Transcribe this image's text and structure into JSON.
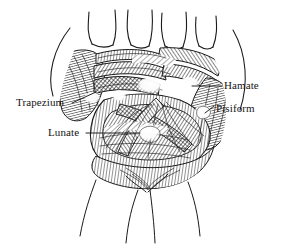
{
  "figure": {
    "type": "anatomical-line-drawing",
    "background_color": "#ffffff",
    "ink_color": "#1a1a1a",
    "width": 281,
    "height": 245
  },
  "labels": [
    {
      "id": "trapezium",
      "text": "Trapezium",
      "side": "left",
      "leader": {
        "from_x": 72,
        "from_y": 103,
        "to_x": 96,
        "to_y": 92
      }
    },
    {
      "id": "lunate",
      "text": "Lunate",
      "side": "left",
      "leader": {
        "from_x": 86,
        "from_y": 133,
        "to_x": 140,
        "to_y": 133
      }
    },
    {
      "id": "hamate",
      "text": "Hamate",
      "side": "right",
      "leader": {
        "from_x": 222,
        "from_y": 86,
        "to_x": 192,
        "to_y": 86
      }
    },
    {
      "id": "pisiform",
      "text": "Pisiform",
      "side": "right",
      "leader": {
        "from_x": 214,
        "from_y": 106,
        "to_x": 205,
        "to_y": 113
      }
    }
  ],
  "structures": {
    "digits": [
      "index-metacarpal",
      "middle-metacarpal",
      "ring-metacarpal",
      "little-metacarpal"
    ],
    "bone_highlights": [
      "trapezium",
      "capitate",
      "hamate",
      "pisiform",
      "lunate"
    ],
    "soft_tissue": [
      "transverse-carpal-ligament",
      "palmar-carpal-ligaments",
      "flexor-tendons",
      "thenar-muscles",
      "hypothenar-muscles"
    ],
    "forearm": "distal-forearm-contour"
  }
}
